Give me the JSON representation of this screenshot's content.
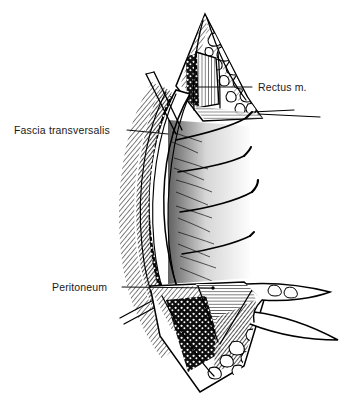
{
  "figure": {
    "type": "pen-and-ink medical illustration",
    "background_color": "#ffffff",
    "ink_color": "#000000",
    "label_color": "#1a1a1a",
    "width": 352,
    "height": 403
  },
  "annotations": [
    {
      "id": "rectus",
      "label": "Rectus m.",
      "text_x": 258,
      "text_y": 91,
      "anchor": "start",
      "leader": "M 252 87 L 198 87",
      "target_structure": "rectus abdominis muscle belly at flap apex"
    },
    {
      "id": "fascia",
      "label": "Fascia transversalis",
      "text_x": 14,
      "text_y": 134,
      "anchor": "start",
      "leader": "M 127 130 L 168 134",
      "target_structure": "transversalis fascia layer on cut edge"
    },
    {
      "id": "peritoneum",
      "label": "Peritoneum",
      "text_x": 52,
      "text_y": 291,
      "anchor": "start",
      "leader": "M 122 287 L 213 288",
      "target_structure": "peritoneal layer at inferior fold"
    }
  ],
  "structures": [
    {
      "name": "superior-flap-apex",
      "note": "triangular flap of abdominal wall retracted upward"
    },
    {
      "name": "adipose-lobules",
      "note": "polygonal subcutaneous fat cells along cut edges"
    },
    {
      "name": "rectus-muscle-striations",
      "note": "vertical muscle fibre hatching"
    },
    {
      "name": "layered-wall-edge",
      "note": "left cut margin with stacked fascial layers"
    },
    {
      "name": "retractor-blade",
      "note": "two thin parallel instrument lines upper left"
    },
    {
      "name": "suture-threads",
      "note": "four curved threads with needle tips to the right"
    },
    {
      "name": "peritoneal-fold",
      "note": "V-shaped inferior fold with dense hatching"
    },
    {
      "name": "inferior-flap",
      "note": "lower triangular flap tapering right"
    }
  ]
}
